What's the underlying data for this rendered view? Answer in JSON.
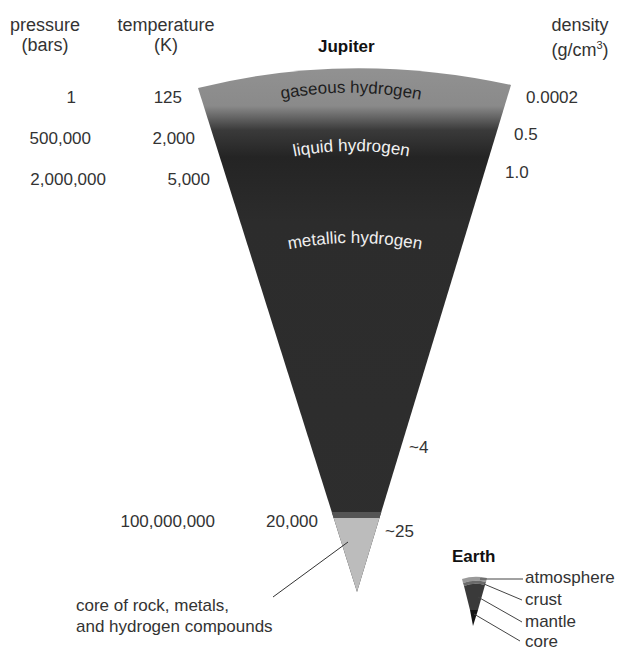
{
  "title": "Jupiter",
  "columns": {
    "pressure": {
      "label": "pressure",
      "unit": "(bars)"
    },
    "temperature": {
      "label": "temperature",
      "unit": "(K)"
    },
    "density": {
      "label": "density",
      "unit_prefix": "(g/cm",
      "unit_sup": "3",
      "unit_suffix": ")"
    }
  },
  "rows": [
    {
      "pressure": "1",
      "temperature": "125",
      "density": "0.0002"
    },
    {
      "pressure": "500,000",
      "temperature": "2,000",
      "density": "0.5"
    },
    {
      "pressure": "2,000,000",
      "temperature": "5,000",
      "density": "1.0"
    },
    {
      "density": "~4"
    },
    {
      "pressure": "100,000,000",
      "temperature": "20,000",
      "density": "~25"
    }
  ],
  "layers": [
    {
      "name": "gaseous hydrogen",
      "color": "#8c8c8c"
    },
    {
      "name": "liquid hydrogen",
      "color": "#2a2a2a"
    },
    {
      "name": "metallic hydrogen",
      "color": "#2e2e2e"
    },
    {
      "name": "core of rock, metals,",
      "name_line2": "and hydrogen compounds",
      "color": "#bdbdbd"
    }
  ],
  "earth": {
    "title": "Earth",
    "layers": [
      {
        "name": "atmosphere",
        "color": "#9a9a9a"
      },
      {
        "name": "crust",
        "color": "#6a6a6a"
      },
      {
        "name": "mantle",
        "color": "#3a3a3a"
      },
      {
        "name": "core",
        "color": "#1a1a1a"
      }
    ]
  }
}
